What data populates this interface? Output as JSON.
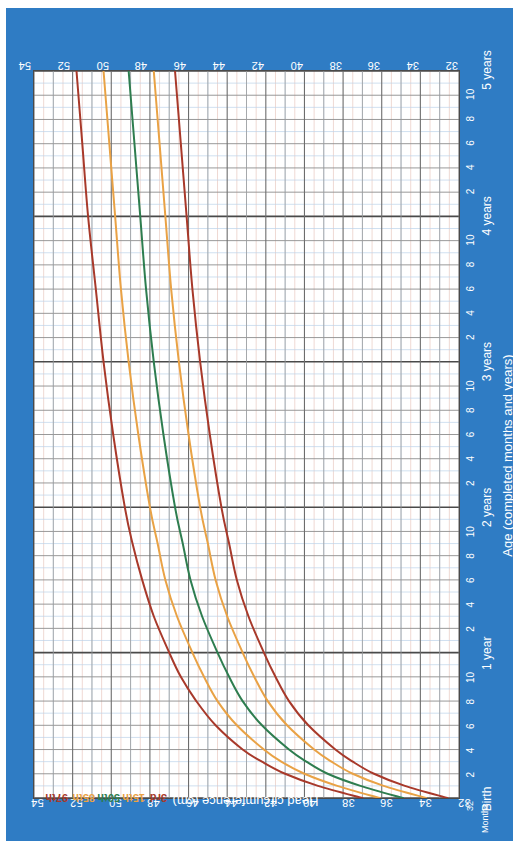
{
  "chart_data": {
    "type": "line",
    "xlabel": "Age (completed months and years)",
    "ylabel": "Head circumference (cm)",
    "ylim": [
      32,
      54
    ],
    "xlim_months": [
      0,
      60
    ],
    "grid": true,
    "legend": "inline-curve-labels",
    "y_ticks": [
      54,
      52,
      50,
      48,
      46,
      44,
      42,
      40,
      38,
      36,
      34,
      32
    ],
    "y_minor_step": 0.5,
    "x_major_ticks": [
      {
        "months": 0,
        "label": "Birth"
      },
      {
        "months": 12,
        "label": "1 year"
      },
      {
        "months": 24,
        "label": "2 years"
      },
      {
        "months": 36,
        "label": "3 years"
      },
      {
        "months": 48,
        "label": "4 years"
      },
      {
        "months": 60,
        "label": "5 years"
      }
    ],
    "x_minor_ticks": [
      {
        "months": 2,
        "label": "2"
      },
      {
        "months": 4,
        "label": "4"
      },
      {
        "months": 6,
        "label": "6"
      },
      {
        "months": 8,
        "label": "8"
      },
      {
        "months": 10,
        "label": "10"
      },
      {
        "months": 14,
        "label": "2"
      },
      {
        "months": 16,
        "label": "4"
      },
      {
        "months": 18,
        "label": "6"
      },
      {
        "months": 20,
        "label": "8"
      },
      {
        "months": 22,
        "label": "10"
      },
      {
        "months": 26,
        "label": "2"
      },
      {
        "months": 28,
        "label": "4"
      },
      {
        "months": 30,
        "label": "6"
      },
      {
        "months": 32,
        "label": "8"
      },
      {
        "months": 34,
        "label": "10"
      },
      {
        "months": 38,
        "label": "2"
      },
      {
        "months": 40,
        "label": "4"
      },
      {
        "months": 42,
        "label": "6"
      },
      {
        "months": 44,
        "label": "8"
      },
      {
        "months": 46,
        "label": "10"
      },
      {
        "months": 50,
        "label": "2"
      },
      {
        "months": 52,
        "label": "4"
      },
      {
        "months": 54,
        "label": "6"
      },
      {
        "months": 56,
        "label": "8"
      },
      {
        "months": 58,
        "label": "10"
      }
    ],
    "months_unit_label": "Months",
    "x_unit_origin_value": "32",
    "series": [
      {
        "name": "97th",
        "label": "97th",
        "color": "#a8392a",
        "x_months": [
          0,
          1,
          2,
          3,
          4,
          6,
          8,
          10,
          12,
          15,
          18,
          21,
          24,
          30,
          36,
          42,
          48,
          54,
          60
        ],
        "values": [
          37.0,
          39.3,
          41.0,
          42.2,
          43.2,
          44.6,
          45.6,
          46.4,
          47.0,
          47.8,
          48.4,
          48.9,
          49.3,
          49.9,
          50.4,
          50.8,
          51.2,
          51.5,
          51.8
        ]
      },
      {
        "name": "85th",
        "label": "85th",
        "color": "#e9a245",
        "x_months": [
          0,
          1,
          2,
          3,
          4,
          6,
          8,
          10,
          12,
          15,
          18,
          21,
          24,
          30,
          36,
          42,
          48,
          54,
          60
        ],
        "values": [
          36.1,
          38.3,
          40.0,
          41.2,
          42.1,
          43.5,
          44.5,
          45.2,
          45.8,
          46.6,
          47.2,
          47.6,
          48.0,
          48.6,
          49.1,
          49.5,
          49.8,
          50.1,
          50.4
        ]
      },
      {
        "name": "50th",
        "label": "50th",
        "color": "#2e7d4f",
        "x_months": [
          0,
          1,
          2,
          3,
          4,
          6,
          8,
          10,
          12,
          15,
          18,
          21,
          24,
          30,
          36,
          42,
          48,
          54,
          60
        ],
        "values": [
          34.9,
          37.1,
          38.8,
          39.9,
          40.8,
          42.2,
          43.2,
          43.9,
          44.5,
          45.3,
          45.9,
          46.3,
          46.7,
          47.3,
          47.8,
          48.2,
          48.5,
          48.8,
          49.1
        ]
      },
      {
        "name": "15th",
        "label": "15th",
        "color": "#e9a245",
        "x_months": [
          0,
          1,
          2,
          3,
          4,
          6,
          8,
          10,
          12,
          15,
          18,
          21,
          24,
          30,
          36,
          42,
          48,
          54,
          60
        ],
        "values": [
          33.7,
          35.9,
          37.5,
          38.6,
          39.5,
          40.9,
          41.9,
          42.6,
          43.2,
          44.0,
          44.6,
          45.0,
          45.4,
          46.0,
          46.5,
          46.9,
          47.2,
          47.5,
          47.8
        ]
      },
      {
        "name": "3rd",
        "label": "3rd",
        "color": "#a8392a",
        "x_months": [
          0,
          1,
          2,
          3,
          4,
          6,
          8,
          10,
          12,
          15,
          18,
          21,
          24,
          30,
          36,
          42,
          48,
          54,
          60
        ],
        "values": [
          32.6,
          34.8,
          36.4,
          37.5,
          38.4,
          39.8,
          40.8,
          41.5,
          42.1,
          42.9,
          43.5,
          43.9,
          44.3,
          44.9,
          45.4,
          45.8,
          46.1,
          46.4,
          46.7
        ]
      }
    ]
  },
  "colors": {
    "page_background": "#2f7cc4",
    "plot_background": "#ffffff",
    "axis_line": "#4a4a4a",
    "major_grid": "#6d6d6d",
    "minor_grid_blue": "#bcd3ea",
    "minor_grid_pink": "#e8c8c0",
    "tick_label": "#ffffff"
  },
  "labels": {
    "y_axis_title": "Head circumference (cm)",
    "x_axis_title": "Age (completed months and years)",
    "months_caption": "Months",
    "birth_caption": "Birth"
  }
}
